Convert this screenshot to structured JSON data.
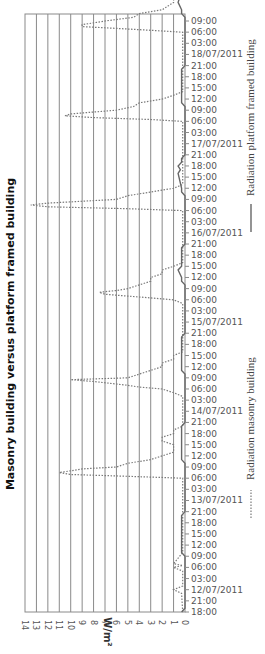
{
  "chart_data": {
    "type": "line",
    "orientation": "rotated-90-ccw",
    "title": "Masonry building versus platform framed building",
    "xlabel": "",
    "ylabel": "W/m²",
    "ylim": [
      0,
      14
    ],
    "yticks": [
      "0",
      "1",
      "2",
      "3",
      "4",
      "5",
      "6",
      "7",
      "8",
      "9",
      "10",
      "11",
      "12",
      "13",
      "14"
    ],
    "grid": true,
    "legend_position": "right",
    "x_tick_labels": [
      "18:00",
      "21:00",
      "12/07/2011",
      "03:00",
      "06:00",
      "09:00",
      "12:00",
      "15:00",
      "18:00",
      "21:00",
      "13/07/2011",
      "03:00",
      "06:00",
      "09:00",
      "12:00",
      "15:00",
      "18:00",
      "21:00",
      "14/07/2011",
      "03:00",
      "06:00",
      "09:00",
      "12:00",
      "15:00",
      "18:00",
      "21:00",
      "15/07/2011",
      "03:00",
      "06:00",
      "09:00",
      "12:00",
      "15:00",
      "18:00",
      "21:00",
      "16/07/2011",
      "03:00",
      "06:00",
      "09:00",
      "12:00",
      "15:00",
      "18:00",
      "21:00",
      "17/07/2011",
      "03:00",
      "06:00",
      "09:00",
      "12:00",
      "15:00",
      "18:00",
      "21:00",
      "18/07/2011",
      "03:00",
      "06:00",
      "09:00"
    ],
    "x_hours_from_start_note": "hours since 11/07/2011 18:00, 3h per tick",
    "series": [
      {
        "name": "Radiation masonry building",
        "style": "dotted",
        "points": [
          [
            0,
            0.2
          ],
          [
            5,
            0.3
          ],
          [
            6,
            1
          ],
          [
            7,
            0.2
          ],
          [
            11,
            0.2
          ],
          [
            12,
            1
          ],
          [
            13,
            1
          ],
          [
            12.5,
            0.2
          ],
          [
            16,
            0.2
          ],
          [
            36,
            0.2
          ],
          [
            36.5,
            5
          ],
          [
            37,
            10
          ],
          [
            37.5,
            11
          ],
          [
            38,
            10
          ],
          [
            38.5,
            9
          ],
          [
            39,
            6
          ],
          [
            40,
            5
          ],
          [
            41,
            3
          ],
          [
            42,
            2
          ],
          [
            43,
            1
          ],
          [
            44,
            1
          ],
          [
            45,
            1
          ],
          [
            46,
            2
          ],
          [
            47,
            2
          ],
          [
            48,
            1
          ],
          [
            49,
            1
          ],
          [
            50,
            0.2
          ],
          [
            58,
            0.2
          ],
          [
            59,
            1
          ],
          [
            60,
            2
          ],
          [
            60.5,
            4
          ],
          [
            61,
            5
          ],
          [
            62,
            8
          ],
          [
            62.5,
            10
          ],
          [
            63,
            5
          ],
          [
            64,
            4
          ],
          [
            65,
            3
          ],
          [
            66,
            2
          ],
          [
            67,
            2
          ],
          [
            68,
            1
          ],
          [
            69,
            1
          ],
          [
            70,
            0.2
          ],
          [
            83,
            0.2
          ],
          [
            84,
            1
          ],
          [
            84.5,
            3
          ],
          [
            85,
            5
          ],
          [
            85.5,
            7
          ],
          [
            86,
            7.5
          ],
          [
            86.5,
            6
          ],
          [
            87,
            5
          ],
          [
            88,
            4
          ],
          [
            89,
            3
          ],
          [
            90,
            3
          ],
          [
            91,
            2
          ],
          [
            92,
            2
          ],
          [
            93,
            1
          ],
          [
            94,
            0.2
          ],
          [
            108,
            0.2
          ],
          [
            108.5,
            5
          ],
          [
            109,
            12
          ],
          [
            109.5,
            13.5
          ],
          [
            110,
            12
          ],
          [
            111,
            6
          ],
          [
            112,
            5
          ],
          [
            113,
            3
          ],
          [
            114,
            1
          ],
          [
            115,
            0.2
          ],
          [
            132,
            0.2
          ],
          [
            132.5,
            3
          ],
          [
            133,
            8
          ],
          [
            133.5,
            10.5
          ],
          [
            134,
            10
          ],
          [
            135,
            6
          ],
          [
            136,
            4.5
          ],
          [
            137,
            4
          ],
          [
            138,
            2
          ],
          [
            139,
            1
          ],
          [
            140,
            0.2
          ],
          [
            156,
            0.2
          ],
          [
            156.5,
            3
          ],
          [
            157,
            6
          ],
          [
            157.5,
            9
          ],
          [
            158,
            9
          ],
          [
            159,
            7
          ],
          [
            160,
            4.5
          ],
          [
            161,
            4
          ],
          [
            162,
            2
          ],
          [
            163,
            1.5
          ],
          [
            164,
            1
          ],
          [
            165,
            1
          ],
          [
            166,
            0.2
          ],
          [
            180,
            0.2
          ],
          [
            180.5,
            3
          ],
          [
            181,
            10
          ],
          [
            181.5,
            11
          ],
          [
            182,
            10
          ],
          [
            183,
            7
          ]
        ]
      },
      {
        "name": "Radiation platform framed building",
        "style": "solid",
        "points": [
          [
            0,
            0.3
          ],
          [
            1,
            0
          ],
          [
            2,
            0
          ],
          [
            15,
            0
          ],
          [
            16,
            0.3
          ],
          [
            17,
            0.3
          ],
          [
            26,
            0.3
          ],
          [
            27,
            0
          ],
          [
            40,
            0
          ],
          [
            41,
            0.3
          ],
          [
            42,
            0.3
          ],
          [
            50,
            0.3
          ],
          [
            51,
            0
          ],
          [
            64,
            0
          ],
          [
            65,
            0.3
          ],
          [
            66,
            0.3
          ],
          [
            74,
            0.3
          ],
          [
            75,
            0
          ],
          [
            88,
            0
          ],
          [
            89,
            0.3
          ],
          [
            90,
            0.3
          ],
          [
            92,
            0.6
          ],
          [
            93,
            0.3
          ],
          [
            98,
            0.3
          ],
          [
            99,
            0
          ],
          [
            112,
            0
          ],
          [
            113,
            0.3
          ],
          [
            114,
            0.3
          ],
          [
            118,
            0.6
          ],
          [
            119,
            0.4
          ],
          [
            120,
            0.6
          ],
          [
            121,
            0.3
          ],
          [
            122,
            0.3
          ],
          [
            123,
            0
          ],
          [
            136,
            0
          ],
          [
            137,
            0.3
          ],
          [
            138,
            0.3
          ],
          [
            146,
            0.3
          ],
          [
            147,
            0
          ],
          [
            160,
            0
          ],
          [
            161,
            0.3
          ],
          [
            162,
            0.3
          ],
          [
            164,
            0.6
          ],
          [
            166,
            0.4
          ],
          [
            168,
            0.6
          ],
          [
            169,
            0.3
          ],
          [
            170,
            0.3
          ],
          [
            171,
            0
          ],
          [
            182,
            0
          ],
          [
            183,
            0.3
          ]
        ]
      }
    ]
  },
  "labels": {
    "title": "Masonry building versus platform framed building",
    "unit": "W/m²",
    "legend_masonry": "Radiation masonry building",
    "legend_platform": "Radiation platform framed building"
  }
}
